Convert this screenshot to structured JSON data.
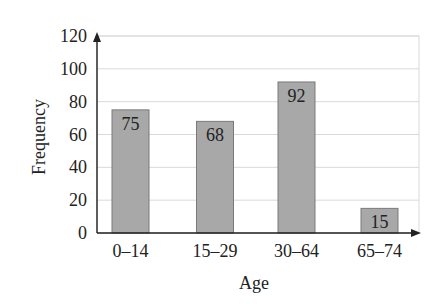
{
  "chart_data": {
    "type": "bar",
    "title": "",
    "xlabel": "Age",
    "ylabel": "Frequency",
    "categories": [
      "0–14",
      "15–29",
      "30–64",
      "65–74"
    ],
    "values": [
      75,
      68,
      92,
      15
    ],
    "data_labels": [
      "75",
      "68",
      "92",
      "15"
    ],
    "ylim": [
      0,
      120
    ],
    "yticks": [
      0,
      20,
      40,
      60,
      80,
      100,
      120
    ],
    "grid": true,
    "legend": null,
    "colors": {
      "bar_fill": "#a8a8a8",
      "bar_stroke": "#7a7a7a",
      "grid": "#d9d9d9",
      "axis": "#222222"
    }
  }
}
